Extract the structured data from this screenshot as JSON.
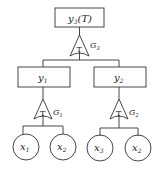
{
  "diagram": {
    "type": "fault-tree",
    "top_event": {
      "label": "y",
      "sub": "3",
      "suffix": "(T)"
    },
    "gates": [
      {
        "id": "G3",
        "symbol": "T",
        "label": "G",
        "sub": "3"
      },
      {
        "id": "G1",
        "symbol": "T",
        "label": "G",
        "sub": "1"
      },
      {
        "id": "G2",
        "symbol": "T",
        "label": "G",
        "sub": "2"
      }
    ],
    "intermediate_events": [
      {
        "label": "y",
        "sub": "1"
      },
      {
        "label": "y",
        "sub": "2"
      }
    ],
    "basic_events": [
      {
        "label": "x",
        "sub": "1"
      },
      {
        "label": "x",
        "sub": "2"
      },
      {
        "label": "x",
        "sub": "3"
      },
      {
        "label": "x",
        "sub": "2"
      }
    ]
  }
}
